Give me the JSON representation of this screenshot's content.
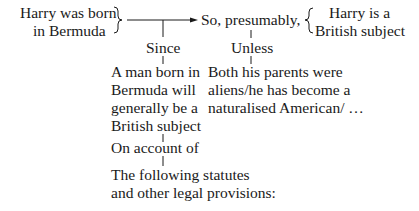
{
  "diagram": {
    "type": "Toulmin argument",
    "data_claim": {
      "line1": "Harry was born",
      "line2": "in Bermuda"
    },
    "qualifier": "So, presumably,",
    "conclusion": {
      "line1": "Harry is a",
      "line2": "British subject"
    },
    "warrant_label": "Since",
    "warrant": {
      "lines": [
        "A man born in",
        "Bermuda will",
        "generally be a",
        "British subject"
      ]
    },
    "rebuttal_label": "Unless",
    "rebuttal": {
      "lines": [
        "Both his parents were",
        "aliens/he has become a",
        "naturalised American/ …"
      ]
    },
    "backing_label": "On account of",
    "backing": {
      "lines": [
        "The following statutes",
        "and other legal provisions:"
      ]
    }
  },
  "colors": {
    "ink": "#1a1a1a",
    "background": "#ffffff"
  }
}
